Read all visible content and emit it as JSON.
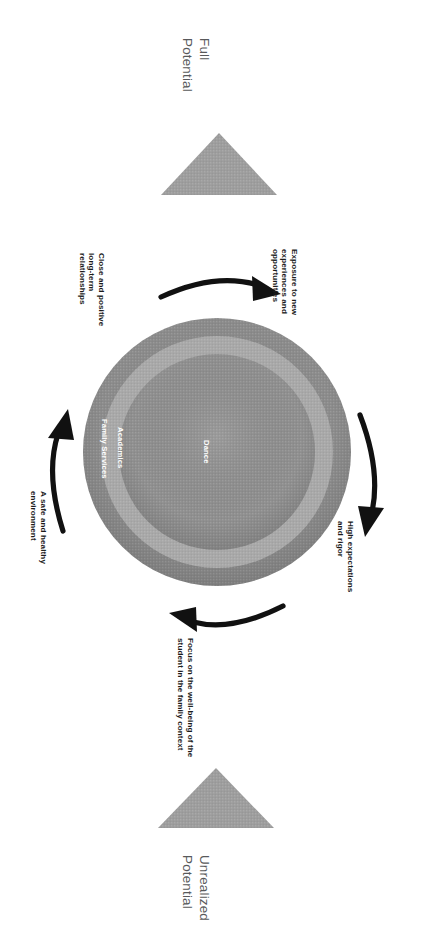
{
  "diagram": {
    "title_top": "Full\nPotential",
    "title_bottom": "Unrealized\nPotential",
    "rings": [
      {
        "name": "outer-ring",
        "label": "Family Services",
        "color": "#8c8c8c"
      },
      {
        "name": "middle-ring",
        "label": "Academics",
        "color": "#a6a6a6"
      },
      {
        "name": "inner-core",
        "label": "Dance",
        "color": "#8f8f8f"
      }
    ],
    "arrow_captions": [
      {
        "name": "caption-relationships",
        "text": "Close and positive\nlong-term\nrelationships"
      },
      {
        "name": "caption-exposure",
        "text": "Exposure to new\nexperiences and\nopportunities"
      },
      {
        "name": "caption-expectations",
        "text": "High expectations\nand rigor"
      },
      {
        "name": "caption-wellbeing",
        "text": "Focus on the well-being of the\nstudent in the family context"
      },
      {
        "name": "caption-environment",
        "text": "A safe and healthy\nenvironment"
      }
    ],
    "triangles": [
      {
        "name": "triangle-full-potential",
        "color": "#9b9b9b"
      },
      {
        "name": "triangle-unrealized-potential",
        "color": "#9b9b9b"
      }
    ],
    "arrows": [
      {
        "name": "arrow-top",
        "color": "#111111"
      },
      {
        "name": "arrow-right",
        "color": "#111111"
      },
      {
        "name": "arrow-bottom",
        "color": "#111111"
      },
      {
        "name": "arrow-left",
        "color": "#111111"
      }
    ],
    "background_color": "#ffffff"
  }
}
